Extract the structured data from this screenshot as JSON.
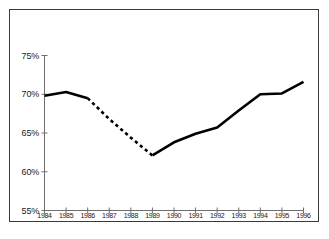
{
  "chart_data": {
    "type": "line",
    "title": "",
    "subtitle": "",
    "xlabel": "",
    "ylabel": "",
    "x": [
      1984,
      1985,
      1986,
      1987,
      1988,
      1989,
      1990,
      1991,
      1992,
      1993,
      1994,
      1995,
      1996
    ],
    "categories": [
      "1984",
      "1985",
      "1986",
      "1987",
      "1988",
      "1989",
      "1990",
      "1991",
      "1992",
      "1993",
      "1994",
      "1995",
      "1996"
    ],
    "values": [
      69.8,
      70.3,
      69.5,
      66.8,
      64.4,
      62.1,
      63.8,
      64.9,
      65.7,
      67.9,
      70.0,
      70.1,
      71.6
    ],
    "series": [
      {
        "name": "percent",
        "values": [
          69.8,
          70.3,
          69.5,
          66.8,
          64.4,
          62.1,
          63.8,
          64.9,
          65.7,
          67.9,
          70.0,
          70.1,
          71.6
        ],
        "style_solid_segments": [
          [
            1984,
            1986
          ],
          [
            1989,
            1996
          ]
        ],
        "style_dashed_segments": [
          [
            1986,
            1989
          ]
        ],
        "color": "#000000",
        "line_width": 2.6
      }
    ],
    "ylim": [
      55,
      75
    ],
    "xlim": [
      1984,
      1996
    ],
    "ytick_values": [
      75,
      70,
      65,
      60,
      55
    ],
    "ytick_labels": [
      "75%",
      "70%",
      "65%",
      "60%",
      "55%"
    ],
    "xtick_labels": [
      "1984",
      "1985",
      "1986",
      "1987",
      "1988",
      "1989",
      "1990",
      "1991",
      "1992",
      "1993",
      "1994",
      "1995",
      "1996"
    ],
    "grid": false,
    "legend": null,
    "legend_position": "none",
    "annotations": [],
    "axis_color": "#6e6e6e",
    "frame_color": "#3a3a3a",
    "background_color": "#ffffff"
  }
}
